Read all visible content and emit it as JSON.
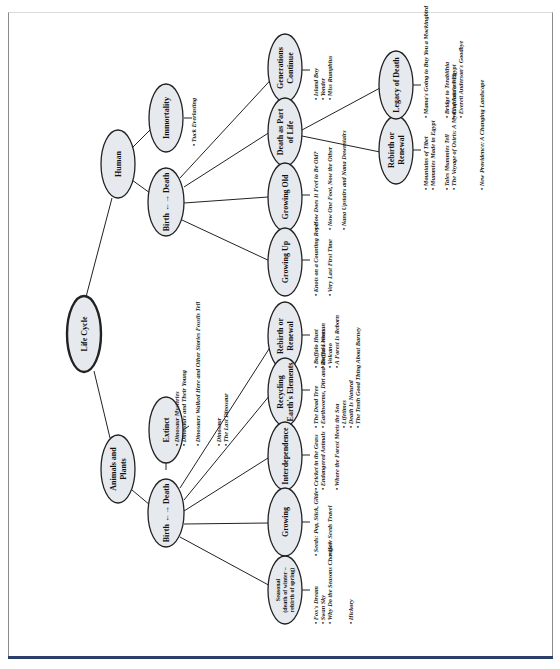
{
  "diagram": {
    "title": "Life Cycle",
    "orientation": "rotated 90° counter-clockwise",
    "branches": {
      "human": {
        "label": "Human",
        "immortality": {
          "label": "Immortality",
          "books": [
            "Tuck Everlasting"
          ]
        },
        "birth_death": {
          "label": "Birth ←→ Death",
          "children": {
            "growing_up": {
              "label": "Growing Up",
              "books": [
                "Knots on a Counting Rope",
                "Very Last First Time"
              ]
            },
            "growing_old": {
              "label": "Growing Old",
              "books": [
                "How Does It Feel to Be Old?",
                "Now One Foot, Now the Other",
                "Nana Upstairs and Nana Downstairs"
              ]
            },
            "death_part_of_life": {
              "label_line1": "Death as Part",
              "label_line2": "of Life",
              "children": {
                "rebirth": {
                  "label_line1": "Rebirth or",
                  "label_line2": "Renewal",
                  "books": [
                    "Mountains of Tibet",
                    "Mummies Made in Egypt",
                    "Tales Mummies Tell",
                    "The Voyage of Osiris: A Myth of Ancient Egypt",
                    "New Providence: A Changing Landscape"
                  ]
                },
                "legacy": {
                  "label": "Legacy of Death",
                  "books": [
                    "Mama's Going to Buy You a Mockingbird",
                    "Bridge to Terabithia",
                    "Charlotte's Web",
                    "Everett Anderson's Goodbye"
                  ]
                }
              }
            },
            "generations": {
              "label_line1": "Generations",
              "label_line2": "Continue",
              "books": [
                "Island Boy",
                "Yonder",
                "Miss Rumphius"
              ]
            }
          }
        }
      },
      "animals": {
        "label_line1": "Animals and",
        "label_line2": "Plants",
        "extinct": {
          "label": "Extinct",
          "books": [
            "Dinosaur Mysteries",
            "Dinosaurs and Their Young",
            "Dinosaurs Walked Here and Other Stories Fossils Tell",
            "Dinosaur",
            "The Last Dinosaur"
          ]
        },
        "birth_death": {
          "label": "Birth ←→ Death",
          "children": {
            "seasonal": {
              "label_line1": "Seasonal",
              "label_line2": "(death of winter –",
              "label_line3": "rebirth of spring)",
              "books": [
                "Fox's Dream",
                "Swan Sky",
                "Why Do the Seasons Change?",
                "Hickory"
              ]
            },
            "growing": {
              "label": "Growing",
              "books": [
                "Seeds: Pop, Stick, Glide",
                "How Seeds Travel"
              ]
            },
            "interdependence": {
              "label": "Interdependence",
              "books": [
                "Cricket in the Grass",
                "Endangered Animals",
                "Where the Forest Meets the Sea"
              ]
            },
            "recycling": {
              "label_line1": "Recycling",
              "label_line2": "Earth's Elements",
              "books": [
                "The Dead Tree",
                "Earthworms, Dirt and Rotten Leaves",
                "Lifetimes",
                "Death Is Natural",
                "The Tenth Good Thing About Barney"
              ]
            },
            "rebirth": {
              "label_line1": "Rebirth or",
              "label_line2": "Renewal",
              "books": [
                "Buffalo Hunt",
                "Buffalo Woman",
                "Volcano",
                "A Forest Is Reborn"
              ]
            }
          }
        }
      }
    }
  },
  "colors": {
    "node_fill": "#e6e9ee",
    "stroke": "#222222",
    "bottom_rule": "#2b3f6b"
  }
}
